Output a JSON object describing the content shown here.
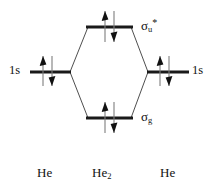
{
  "diagram": {
    "colors": {
      "level": "#1a1a1a",
      "correlation": "#3a3a3a",
      "arrow_shaft": "#7e7e7e",
      "arrow_head": "#111111",
      "background": "#ffffff"
    },
    "atomic_orbitals": [
      {
        "id": "ao-left",
        "label": "1s",
        "electrons": 2,
        "spins": [
          "up",
          "down"
        ]
      },
      {
        "id": "ao-right",
        "label": "1s",
        "electrons": 2,
        "spins": [
          "up",
          "down"
        ]
      }
    ],
    "molecular_orbitals": [
      {
        "id": "mo-antibonding",
        "symbol": "σ",
        "subscript": "u",
        "superscript": "*",
        "type": "antibonding",
        "electrons": 2,
        "spins": [
          "up",
          "down"
        ]
      },
      {
        "id": "mo-bonding",
        "symbol": "σ",
        "subscript": "g",
        "superscript": "",
        "type": "bonding",
        "electrons": 2,
        "spins": [
          "up",
          "down"
        ]
      }
    ],
    "species": [
      {
        "id": "species-left",
        "formula": "He",
        "subscript": ""
      },
      {
        "id": "species-center",
        "formula": "He",
        "subscript": "2"
      },
      {
        "id": "species-right",
        "formula": "He",
        "subscript": ""
      }
    ]
  }
}
